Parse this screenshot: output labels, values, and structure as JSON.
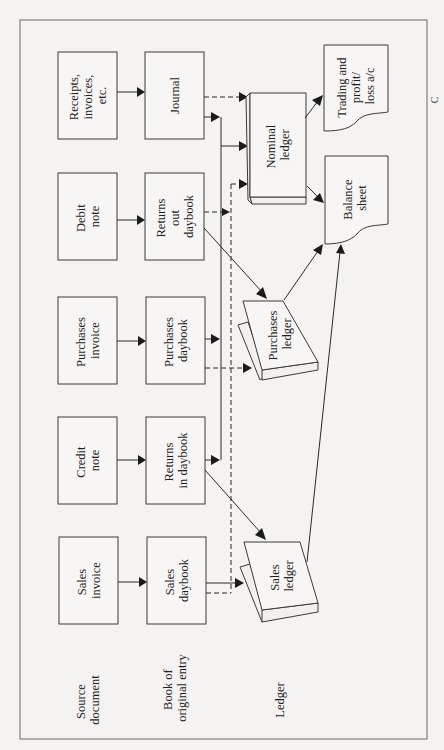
{
  "diagram": {
    "orientation": "rotated 90 degrees counter-clockwise",
    "row_labels": {
      "source": [
        "Source",
        "document"
      ],
      "book": [
        "Book of",
        "original entry"
      ],
      "ledger": [
        "Ledger"
      ]
    },
    "source_documents": [
      {
        "id": "receipts",
        "lines": [
          "Receipts,",
          "invoices,",
          "etc."
        ]
      },
      {
        "id": "debit",
        "lines": [
          "Debit",
          "note"
        ]
      },
      {
        "id": "purchases_invoice",
        "lines": [
          "Purchases",
          "invoice"
        ]
      },
      {
        "id": "credit",
        "lines": [
          "Credit",
          "note"
        ]
      },
      {
        "id": "sales_invoice",
        "lines": [
          "Sales",
          "invoice"
        ]
      }
    ],
    "books_of_original_entry": [
      {
        "id": "journal",
        "lines": [
          "Journal"
        ]
      },
      {
        "id": "returns_out",
        "lines": [
          "Returns",
          "out",
          "daybook"
        ]
      },
      {
        "id": "purchases_daybook",
        "lines": [
          "Purchases",
          "daybook"
        ]
      },
      {
        "id": "returns_in",
        "lines": [
          "Returns",
          "in daybook"
        ]
      },
      {
        "id": "sales_daybook",
        "lines": [
          "Sales",
          "daybook"
        ]
      }
    ],
    "ledgers": [
      {
        "id": "nominal",
        "lines": [
          "Nominal",
          "ledger"
        ]
      },
      {
        "id": "purchases_ledger",
        "lines": [
          "Purchases",
          "ledger"
        ]
      },
      {
        "id": "sales_ledger",
        "lines": [
          "Sales",
          "ledger"
        ]
      }
    ],
    "final_accounts": [
      {
        "id": "trading",
        "lines": [
          "Trading and",
          "profit/",
          "loss a/c"
        ]
      },
      {
        "id": "balance",
        "lines": [
          "Balance",
          "sheet"
        ]
      }
    ],
    "edge_mark": "C",
    "flows": [
      {
        "from": "Receipts, invoices, etc.",
        "to": "Journal",
        "style": "solid"
      },
      {
        "from": "Debit note",
        "to": "Returns out daybook",
        "style": "solid"
      },
      {
        "from": "Purchases invoice",
        "to": "Purchases daybook",
        "style": "solid"
      },
      {
        "from": "Credit note",
        "to": "Returns in daybook",
        "style": "solid"
      },
      {
        "from": "Sales invoice",
        "to": "Sales daybook",
        "style": "solid"
      },
      {
        "from": "Journal",
        "to": "Nominal ledger",
        "style": "dashed"
      },
      {
        "from": "Journal",
        "to": "Nominal ledger",
        "style": "solid"
      },
      {
        "from": "Purchases daybook",
        "to": "Nominal ledger",
        "style": "solid"
      },
      {
        "from": "Returns in daybook",
        "to": "Nominal ledger",
        "style": "solid"
      },
      {
        "from": "Returns out daybook",
        "to": "Nominal ledger",
        "style": "dashed"
      },
      {
        "from": "Sales daybook",
        "to": "Nominal ledger",
        "style": "dashed"
      },
      {
        "from": "Returns out daybook",
        "to": "Purchases ledger",
        "style": "solid"
      },
      {
        "from": "Purchases daybook",
        "to": "Purchases ledger",
        "style": "dashed"
      },
      {
        "from": "Returns in daybook",
        "to": "Sales ledger",
        "style": "solid"
      },
      {
        "from": "Sales daybook",
        "to": "Sales ledger",
        "style": "solid"
      },
      {
        "from": "Nominal ledger",
        "to": "Trading and profit/loss a/c",
        "style": "solid"
      },
      {
        "from": "Nominal ledger",
        "to": "Balance sheet",
        "style": "solid"
      },
      {
        "from": "Purchases ledger",
        "to": "Balance sheet",
        "style": "solid"
      },
      {
        "from": "Sales ledger",
        "to": "Balance sheet",
        "style": "solid"
      }
    ]
  }
}
